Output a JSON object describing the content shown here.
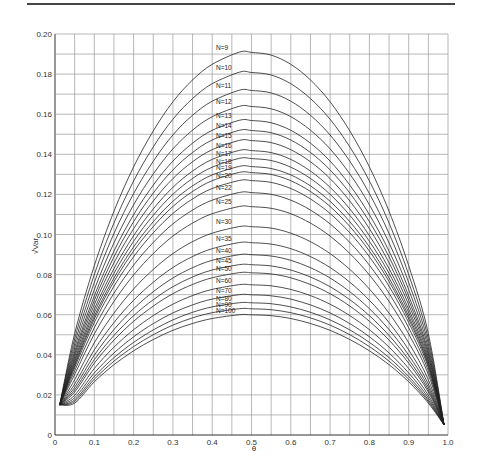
{
  "chart_data": {
    "type": "line",
    "title": "",
    "xlabel": "θ",
    "ylabel": "√Var",
    "xlim": [
      0,
      1.0
    ],
    "ylim": [
      0,
      0.2
    ],
    "grid": true,
    "x_ticks": [
      "0",
      "0.1",
      "0.2",
      "0.3",
      "0.4",
      "0.5",
      "0.6",
      "0.7",
      "0.8",
      "0.9",
      "1.0"
    ],
    "y_ticks": [
      "0",
      "0.02",
      "0.04",
      "0.06",
      "0.08",
      "0.10",
      "0.12",
      "0.14",
      "0.16",
      "0.18",
      "0.20"
    ],
    "x": [
      0.012,
      0.05,
      0.1,
      0.15,
      0.2,
      0.25,
      0.3,
      0.35,
      0.4,
      0.47,
      0.5,
      0.55,
      0.6,
      0.65,
      0.7,
      0.75,
      0.8,
      0.85,
      0.9,
      0.95,
      0.99
    ],
    "shape": [
      0.087,
      0.265,
      0.442,
      0.584,
      0.7,
      0.794,
      0.87,
      0.927,
      0.968,
      1.0,
      0.999,
      0.992,
      0.968,
      0.927,
      0.87,
      0.794,
      0.7,
      0.584,
      0.442,
      0.265,
      0.076
    ],
    "start_value": 0.015,
    "end_value": 0.005,
    "series": [
      {
        "name": "N=9",
        "peak": 0.191
      },
      {
        "name": "N=10",
        "peak": 0.181
      },
      {
        "name": "N=11",
        "peak": 0.172
      },
      {
        "name": "N=12",
        "peak": 0.164
      },
      {
        "name": "N=13",
        "peak": 0.157
      },
      {
        "name": "N=14",
        "peak": 0.152
      },
      {
        "name": "N=15",
        "peak": 0.147
      },
      {
        "name": "N=16",
        "peak": 0.142
      },
      {
        "name": "N=17",
        "peak": 0.138
      },
      {
        "name": "N=18",
        "peak": 0.134
      },
      {
        "name": "N=19",
        "peak": 0.131
      },
      {
        "name": "N=20",
        "peak": 0.127
      },
      {
        "name": "N=22",
        "peak": 0.121
      },
      {
        "name": "N=25",
        "peak": 0.114
      },
      {
        "name": "N=30",
        "peak": 0.104
      },
      {
        "name": "N=35",
        "peak": 0.096
      },
      {
        "name": "N=40",
        "peak": 0.09
      },
      {
        "name": "N=45",
        "peak": 0.085
      },
      {
        "name": "N=50",
        "peak": 0.081
      },
      {
        "name": "N=60",
        "peak": 0.075
      },
      {
        "name": "N=70",
        "peak": 0.07
      },
      {
        "name": "N=80",
        "peak": 0.066
      },
      {
        "name": "N=90",
        "peak": 0.063
      },
      {
        "name": "N=100",
        "peak": 0.06
      }
    ]
  }
}
